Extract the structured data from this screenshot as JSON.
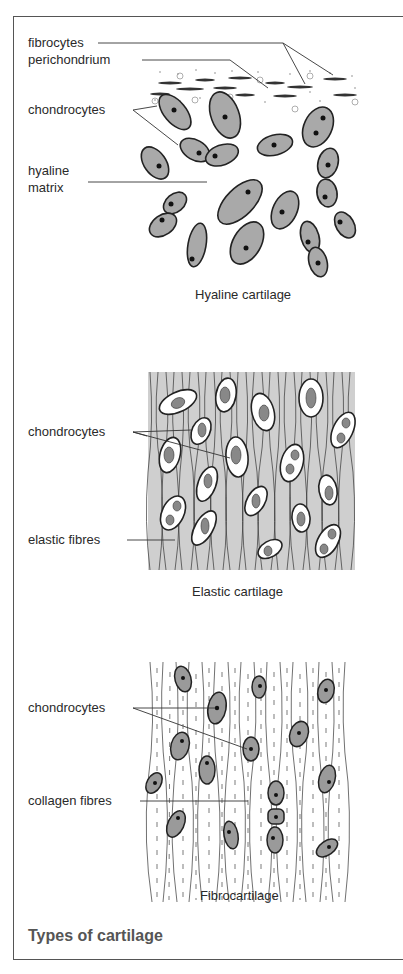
{
  "figure": {
    "title": "Types of cartilage",
    "panels": [
      {
        "name": "hyaline",
        "caption": "Hyaline cartilage",
        "labels": [
          "fibrocytes",
          "perichondrium",
          "chondrocytes",
          "hyaline",
          "matrix"
        ]
      },
      {
        "name": "elastic",
        "caption": "Elastic cartilage",
        "labels": [
          "chondrocytes",
          "elastic fibres"
        ]
      },
      {
        "name": "fibro",
        "caption": "Fibrocartilage",
        "labels": [
          "chondrocytes",
          "collagen fibres"
        ]
      }
    ]
  },
  "colors": {
    "frame": "#555555",
    "hyaline_cell_fill": "#a9a9a9",
    "elastic_matrix": "#c8c8c8",
    "fibro_cell_fill": "#9a9a9a",
    "title": "#555555"
  }
}
